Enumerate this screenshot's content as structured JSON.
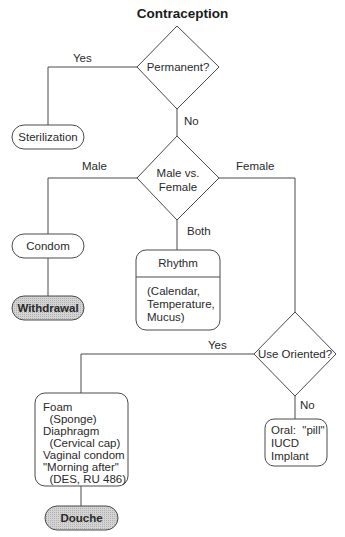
{
  "title": "Contraception",
  "nodes": {
    "permanent": {
      "label": "Permanent?",
      "shape": "diamond"
    },
    "sterilization": {
      "label": "Sterilization",
      "shape": "pill"
    },
    "male_vs_female": {
      "line1": "Male vs.",
      "line2": "Female",
      "shape": "diamond"
    },
    "condom": {
      "label": "Condom",
      "shape": "pill"
    },
    "withdrawal": {
      "label": "Withdrawal",
      "shape": "pill",
      "shaded": true
    },
    "rhythm": {
      "header": "Rhythm",
      "lines": [
        "(Calendar,",
        "Temperature,",
        "Mucus)"
      ],
      "shape": "rounded-box"
    },
    "use_oriented": {
      "label": "Use Oriented?",
      "shape": "diamond"
    },
    "barrier": {
      "lines": [
        "Foam",
        "  (Sponge)",
        "Diaphragm",
        "  (Cervical cap)",
        "Vaginal condom",
        "\"Morning after\"",
        "  (DES, RU 486)"
      ],
      "shape": "rounded-box"
    },
    "douche": {
      "label": "Douche",
      "shape": "pill",
      "shaded": true
    },
    "hormonal": {
      "lines": [
        "Oral:  \"pill\"",
        "IUCD",
        "Implant"
      ],
      "shape": "rounded-box"
    }
  },
  "edges": {
    "permanent_yes": "Yes",
    "permanent_no": "No",
    "mvf_male": "Male",
    "mvf_female": "Female",
    "mvf_both": "Both",
    "use_yes": "Yes",
    "use_no": "No"
  },
  "colors": {
    "line": "#4a4a4a",
    "shaded_fill": "#c8c8c8",
    "background": "#ffffff"
  }
}
